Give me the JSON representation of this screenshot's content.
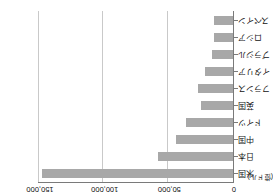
{
  "chart_data": {
    "type": "bar",
    "orientation": "horizontal",
    "title": "",
    "subtitle": "",
    "unit_label": "(億ドル)",
    "xlabel": "",
    "ylabel": "",
    "xlim": [
      0,
      150000
    ],
    "xticks": [
      0,
      50000,
      100000,
      150000
    ],
    "xtick_labels": [
      "0",
      "50,000",
      "100,000",
      "150,000"
    ],
    "grid": true,
    "grid_axis": "x",
    "legend": false,
    "legend_position": "none",
    "value_axis_position": "top",
    "category_axis_position": "right",
    "rotated_180": true,
    "bar_color": "#a8a8a8",
    "gridline_color": "#c9c9c9",
    "axis_color": "#7a7a7a",
    "categories": [
      "米国",
      "日本",
      "中国",
      "ドイツ",
      "英国",
      "フランス",
      "イタリア",
      "ブラジル",
      "ロシア",
      "スペイン"
    ],
    "values": [
      148000,
      58000,
      44000,
      36000,
      25000,
      27000,
      22000,
      16000,
      15000,
      14500
    ],
    "series": [
      {
        "name": "",
        "values": [
          148000,
          58000,
          44000,
          36000,
          25000,
          27000,
          22000,
          16000,
          15000,
          14500
        ]
      }
    ]
  }
}
